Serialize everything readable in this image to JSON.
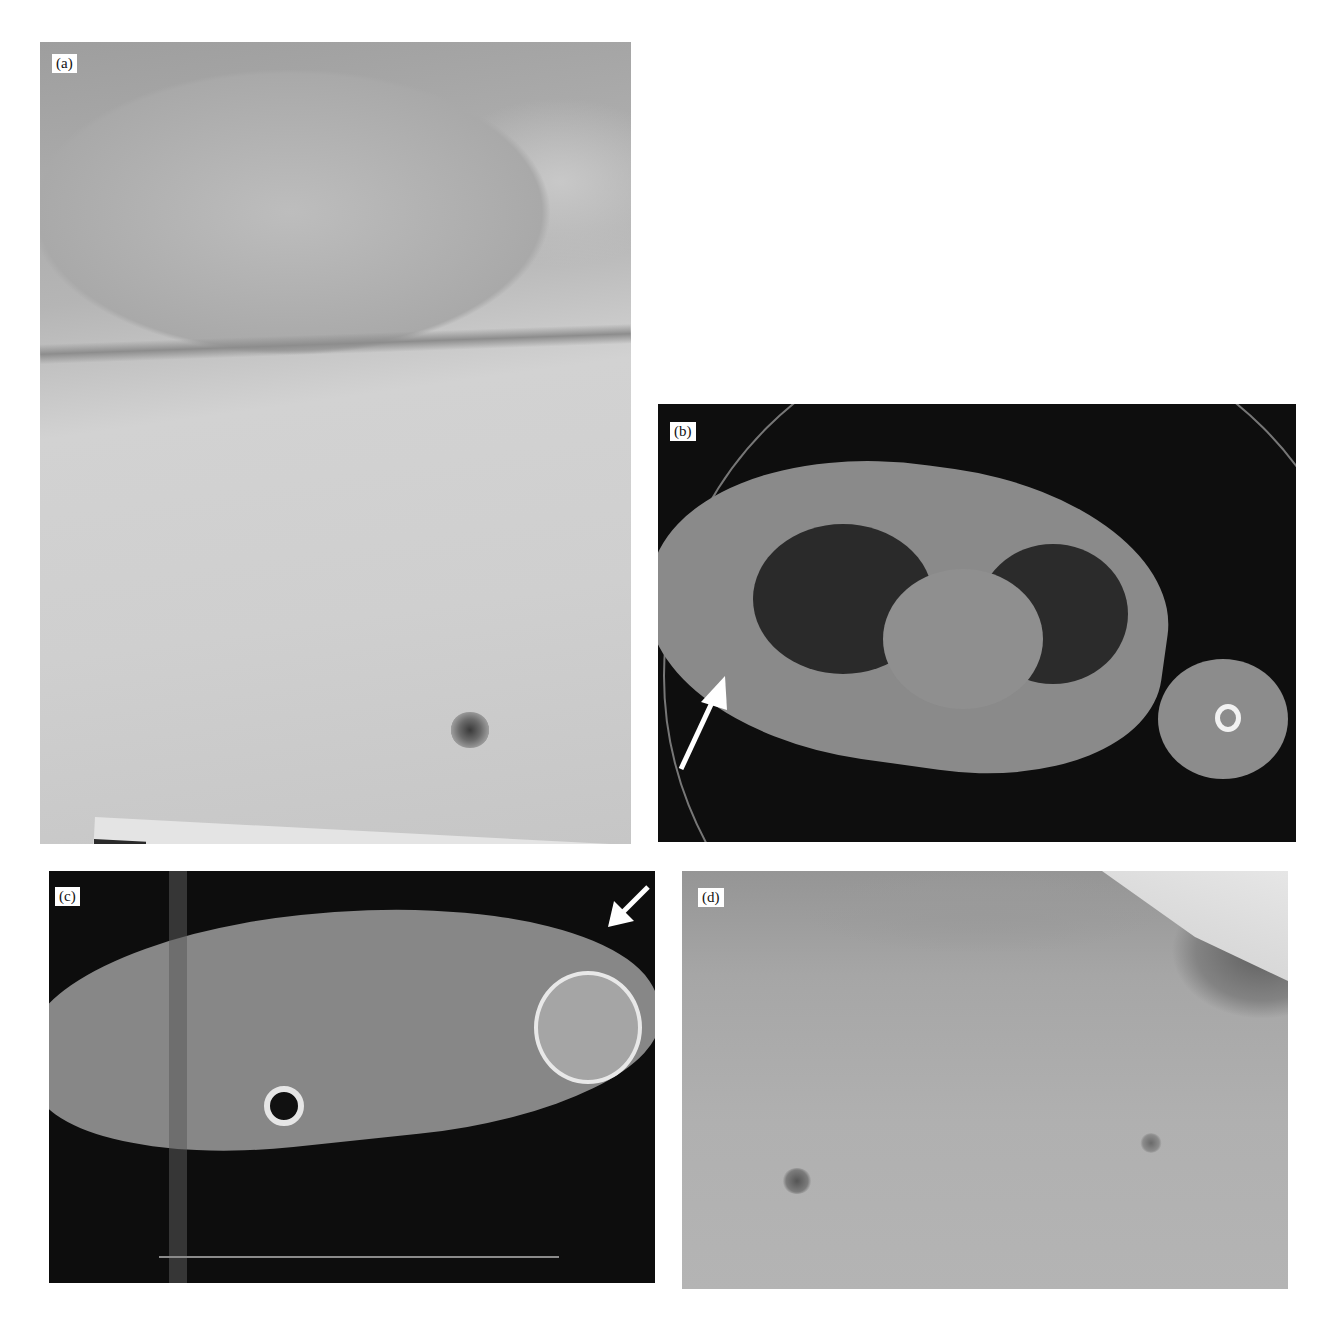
{
  "figure": {
    "panels": [
      {
        "id": "a",
        "label": "(a)",
        "type": "clinical-photograph",
        "description": "Chest wall with nipple and scale ruler at bottom"
      },
      {
        "id": "b",
        "label": "(b)",
        "type": "axial-CT",
        "description": "Axial CT of chest with white arrow pointing at rib region on left"
      },
      {
        "id": "c",
        "label": "(c)",
        "type": "axial-CT",
        "description": "Axial CT of shoulder level with white arrow at humeral head"
      },
      {
        "id": "d",
        "label": "(d)",
        "type": "clinical-photograph",
        "description": "Anterior chest and shoulder with bruising at shoulder"
      }
    ]
  }
}
